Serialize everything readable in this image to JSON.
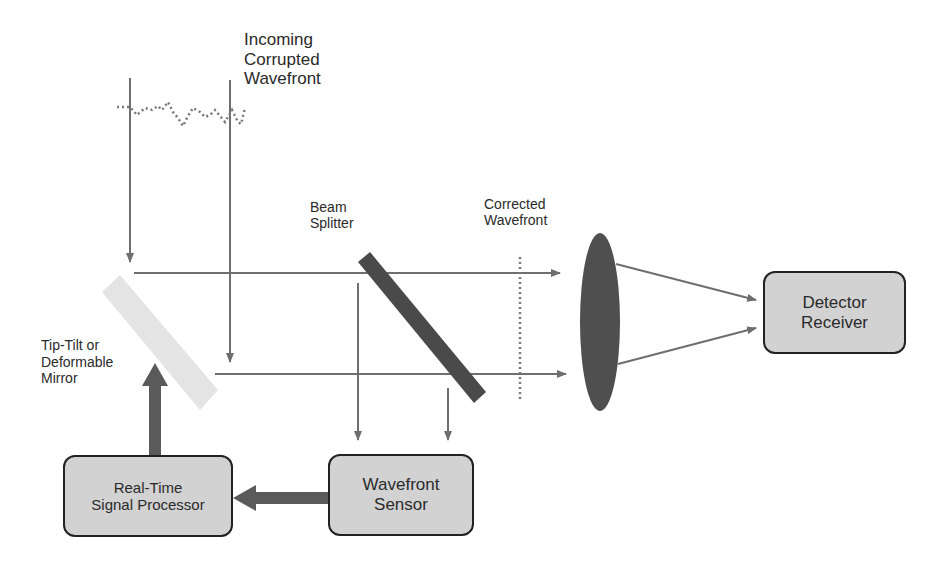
{
  "labels": {
    "incoming": [
      "Incoming",
      "Corrupted",
      "Wavefront"
    ],
    "beam_splitter": [
      "Beam",
      "Splitter"
    ],
    "corrected": [
      "Corrected",
      "Wavefront"
    ],
    "mirror": [
      "Tip-Tilt or",
      "Deformable",
      "Mirror"
    ]
  },
  "boxes": {
    "detector": [
      "Detector",
      "Receiver"
    ],
    "processor": [
      "Real-Time",
      "Signal Processor"
    ],
    "sensor": [
      "Wavefront",
      "Sensor"
    ]
  },
  "colors": {
    "line": "#6e6e6e",
    "thick_arrow": "#5a5a5a",
    "splitter": "#4a4a4a",
    "lens": "#4f4f4f",
    "mirror": "#e6e6e6",
    "box_fill": "#d2d2d2",
    "box_border": "#222222"
  }
}
